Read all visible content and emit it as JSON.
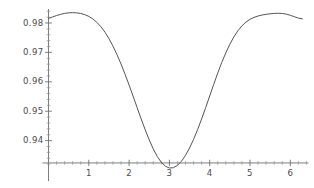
{
  "chart_data": {
    "type": "line",
    "title": "",
    "subtitle": "",
    "xlabel": "",
    "ylabel": "",
    "grid": false,
    "legend": false,
    "legend_position": "none",
    "xlim": [
      -0.15,
      6.45
    ],
    "ylim": [
      0.9285,
      0.9842
    ],
    "xticks": [
      1,
      2,
      3,
      4,
      5,
      6
    ],
    "xtick_labels": [
      "1",
      "2",
      "3",
      "4",
      "5",
      "6"
    ],
    "yticks": [
      0.94,
      0.95,
      0.96,
      0.97,
      0.98
    ],
    "ytick_labels": [
      "0.94",
      "0.95",
      "0.96",
      "0.97",
      "0.98"
    ],
    "minor_xtick_step": 0.2,
    "minor_ytick_step": 0.002,
    "axis_origin": [
      0,
      0.9324
    ],
    "line_color": "#555555",
    "axis_color": "#777777",
    "text_color": "#4a4a4a",
    "background_color": "#ffffff",
    "series": [
      {
        "name": "curve",
        "x": [
          0.0,
          0.1,
          0.2,
          0.3,
          0.4,
          0.5,
          0.6,
          0.7,
          0.8,
          0.9,
          1.0,
          1.1,
          1.2,
          1.3,
          1.4,
          1.5,
          1.6,
          1.7,
          1.8,
          1.9,
          2.0,
          2.1,
          2.2,
          2.3,
          2.4,
          2.5,
          2.6,
          2.7,
          2.8,
          2.9,
          3.0,
          3.1,
          3.2,
          3.3,
          3.4,
          3.5,
          3.6,
          3.7,
          3.8,
          3.9,
          4.0,
          4.1,
          4.2,
          4.3,
          4.4,
          4.5,
          4.6,
          4.7,
          4.8,
          4.9,
          5.0,
          5.1,
          5.2,
          5.3,
          5.4,
          5.5,
          5.6,
          5.7,
          5.8,
          5.9,
          6.0,
          6.1,
          6.2,
          6.3
        ],
        "y": [
          0.98155,
          0.98205,
          0.98253,
          0.98295,
          0.98327,
          0.98346,
          0.98352,
          0.98345,
          0.98324,
          0.98285,
          0.98225,
          0.98139,
          0.98022,
          0.97873,
          0.97689,
          0.97469,
          0.97213,
          0.96924,
          0.96604,
          0.96257,
          0.95889,
          0.95507,
          0.95119,
          0.94735,
          0.94366,
          0.94022,
          0.93716,
          0.93459,
          0.93261,
          0.93129,
          0.93068,
          0.93078,
          0.93157,
          0.93299,
          0.93498,
          0.93748,
          0.94042,
          0.94374,
          0.94737,
          0.95122,
          0.95518,
          0.95914,
          0.96297,
          0.96657,
          0.96986,
          0.97278,
          0.97528,
          0.97736,
          0.97903,
          0.98031,
          0.98125,
          0.98192,
          0.98238,
          0.98271,
          0.98295,
          0.98313,
          0.98326,
          0.98331,
          0.98324,
          0.98302,
          0.98263,
          0.98213,
          0.98167,
          0.98141
        ]
      }
    ]
  },
  "axes": {
    "y_labels": [
      "0.98",
      "0.97",
      "0.96",
      "0.95",
      "0.94"
    ],
    "x_labels": [
      "1",
      "2",
      "3",
      "4",
      "5",
      "6"
    ]
  }
}
